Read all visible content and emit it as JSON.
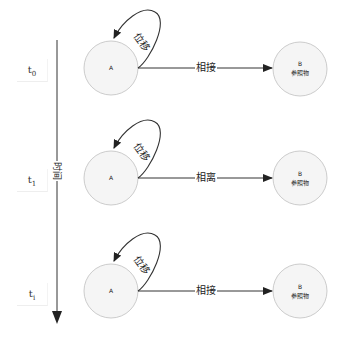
{
  "diagram": {
    "time_axis": {
      "label": "时间",
      "direction": "down"
    },
    "time_labels": [
      {
        "base": "t",
        "sub": "0"
      },
      {
        "base": "t",
        "sub": "1"
      },
      {
        "base": "t",
        "sub": "i"
      }
    ],
    "rows": [
      {
        "node_a": {
          "label": "A"
        },
        "node_b": {
          "label": "B",
          "sublabel": "参照物"
        },
        "loop_label": "位移",
        "edge_label": "相接"
      },
      {
        "node_a": {
          "label": "A"
        },
        "node_b": {
          "label": "B",
          "sublabel": "参照物"
        },
        "loop_label": "位移",
        "edge_label": "相离"
      },
      {
        "node_a": {
          "label": "A"
        },
        "node_b": {
          "label": "B",
          "sublabel": "参照物"
        },
        "loop_label": "位移",
        "edge_label": "相接"
      }
    ],
    "colors": {
      "node_fill": "#f5f5f5",
      "node_stroke": "#cccccc",
      "edge": "#333333"
    }
  }
}
